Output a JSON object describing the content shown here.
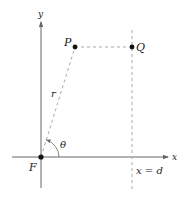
{
  "diagram": {
    "axes": {
      "x_label": "x",
      "y_label": "y"
    },
    "points": {
      "focus": {
        "label": "F"
      },
      "p": {
        "label": "P"
      },
      "q": {
        "label": "Q"
      }
    },
    "labels": {
      "radius": "r",
      "angle": "θ",
      "directrix": "x = d"
    },
    "colors": {
      "axis": "#666666",
      "dashed": "#aaaaaa",
      "point": "#111111",
      "text": "#222222"
    }
  }
}
